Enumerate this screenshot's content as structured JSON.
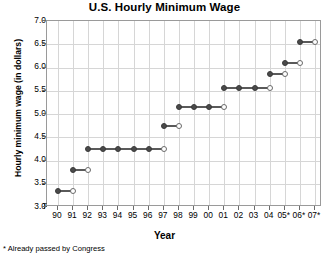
{
  "chart_data": {
    "type": "line",
    "title": "U.S. Hourly Minimum Wage",
    "xlabel": "Year",
    "ylabel": "Hourly minimum wage (in dollars)",
    "footnote": "* Already passed by Congress",
    "grid": true,
    "legend": "none",
    "xlim": [
      90,
      107
    ],
    "ylim": [
      3.0,
      7.0
    ],
    "ytick_labels": [
      "7.0",
      "6.5",
      "6.0",
      "5.5",
      "5.0",
      "4.5",
      "4.0",
      "3.5",
      "3.0"
    ],
    "ytick_values": [
      7.0,
      6.5,
      6.0,
      5.5,
      5.0,
      4.5,
      4.0,
      3.5,
      3.0
    ],
    "xtick_labels": [
      "90",
      "91",
      "92",
      "93",
      "94",
      "95",
      "96",
      "97",
      "98",
      "99",
      "00",
      "01",
      "02",
      "03",
      "04",
      "05*",
      "06*",
      "07*"
    ],
    "xtick_values": [
      90,
      91,
      92,
      93,
      94,
      95,
      96,
      97,
      98,
      99,
      100,
      101,
      102,
      103,
      104,
      105,
      106,
      107
    ],
    "categories": [
      "90",
      "91",
      "92",
      "93",
      "94",
      "95",
      "96",
      "97",
      "98",
      "99",
      "00",
      "01",
      "02",
      "03",
      "04",
      "05*",
      "06*",
      "07*"
    ],
    "values": [
      3.35,
      3.8,
      4.25,
      4.25,
      4.25,
      4.25,
      4.25,
      4.75,
      5.15,
      5.15,
      5.15,
      5.55,
      5.55,
      5.55,
      5.85,
      6.1,
      6.55,
      6.55
    ],
    "segments": [
      {
        "label": "90-91",
        "value": 3.35,
        "x_start": 90,
        "x_end": 91,
        "start_marker": "closed",
        "end_marker": "open",
        "mid_markers": []
      },
      {
        "label": "91-92",
        "value": 3.8,
        "x_start": 91,
        "x_end": 92,
        "start_marker": "closed",
        "end_marker": "open",
        "mid_markers": []
      },
      {
        "label": "92-97",
        "value": 4.25,
        "x_start": 92,
        "x_end": 97,
        "start_marker": "closed",
        "end_marker": "open",
        "mid_markers": [
          93,
          94,
          95,
          96
        ]
      },
      {
        "label": "97-98",
        "value": 4.75,
        "x_start": 97,
        "x_end": 98,
        "start_marker": "closed",
        "end_marker": "open",
        "mid_markers": []
      },
      {
        "label": "98-01",
        "value": 5.15,
        "x_start": 98,
        "x_end": 101,
        "start_marker": "closed",
        "end_marker": "open",
        "mid_markers": [
          99,
          100
        ]
      },
      {
        "label": "01-04",
        "value": 5.55,
        "x_start": 101,
        "x_end": 104,
        "start_marker": "closed",
        "end_marker": "open",
        "mid_markers": [
          102,
          103
        ]
      },
      {
        "label": "04-05",
        "value": 5.85,
        "x_start": 104,
        "x_end": 105,
        "start_marker": "closed",
        "end_marker": "open",
        "mid_markers": []
      },
      {
        "label": "05-06",
        "value": 6.1,
        "x_start": 105,
        "x_end": 106,
        "start_marker": "closed",
        "end_marker": "open",
        "mid_markers": []
      },
      {
        "label": "06-07",
        "value": 6.55,
        "x_start": 106,
        "x_end": 107,
        "start_marker": "closed",
        "end_marker": "open",
        "mid_markers": []
      }
    ],
    "colors": {
      "line": "#5a5a5a",
      "marker_fill": "#4a4a4a",
      "marker_open": "#ffffff",
      "grid": "#d6d6d6",
      "axis": "#9a9a9a",
      "background": "#ffffff",
      "text": "#000000"
    }
  }
}
